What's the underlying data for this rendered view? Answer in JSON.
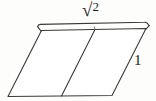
{
  "figure": {
    "type": "geometry-diagram",
    "background_color": "#fdfdfc",
    "stroke_color": "#3a3a3a",
    "stroke_width": 1.1,
    "labels": {
      "top": {
        "text": "√2",
        "radical_sign": "√",
        "radicand": "2",
        "meaning": "square root of 2",
        "position": "above top edge, centered"
      },
      "right": {
        "text": "1",
        "meaning": "unit length",
        "position": "right of the right slanted edge"
      }
    },
    "geometry": {
      "main_parallelogram": {
        "top_left": [
          41.5,
          30.5
        ],
        "top_right": [
          146.0,
          28.5
        ],
        "bottom_right": [
          112.0,
          95.5
        ],
        "bottom_left": [
          8.0,
          96.5
        ]
      },
      "interior_diagonal": {
        "from": [
          95.0,
          29.5
        ],
        "to": [
          61.5,
          96.0
        ]
      },
      "top_lid_strip": {
        "outer_from": [
          37.5,
          25.0
        ],
        "outer_to": [
          148.0,
          22.5
        ],
        "inner_from": [
          41.5,
          30.5
        ],
        "inner_to": [
          146.0,
          28.5
        ],
        "corner_style": "rounded-left, angled-right"
      }
    }
  }
}
